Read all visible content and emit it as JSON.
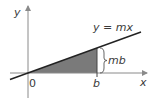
{
  "diagram": {
    "labels": {
      "y_axis": "y",
      "x_axis": "x",
      "origin": "0",
      "b_point": "b",
      "line_eq": "y = mx",
      "height": "mb"
    },
    "colors": {
      "axis": "#8a8a8a",
      "line": "#222222",
      "shade": "#7a7a7a",
      "text": "#3a3a3a"
    }
  }
}
